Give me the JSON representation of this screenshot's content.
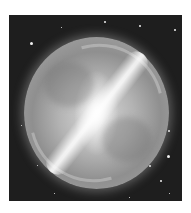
{
  "image": {
    "subject": "barred spiral galaxy / nebula sphere",
    "style": "grayscale",
    "background": "#1e1e1e",
    "page_background": "#ffffff"
  }
}
